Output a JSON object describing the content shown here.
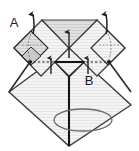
{
  "figure": {
    "type": "paper-folding-diagram",
    "background_color": "#ffffff",
    "paper_fill_color": "#f2f2f2",
    "paper_texture_color": "#e4e4e4",
    "outline_color": "#3a3a3a",
    "dark_line_color": "#111111",
    "shaded_fill_color": "#d0d0d0",
    "dark_fill_color": "#2b2b2b"
  },
  "labels": [
    {
      "name": "label-a",
      "text": "A",
      "x": 14,
      "y": 22
    },
    {
      "name": "label-b",
      "text": "B",
      "x": 89,
      "y": 80
    }
  ],
  "annotations": {
    "arrow_up_left_corner": "fold-up-arrow-left",
    "arrow_up_right_corner": "fold-up-arrow-right",
    "arrow_up_center": "fold-up-arrow-center",
    "arrow_up_inner_left": "fold-up-arrow-inner-left",
    "arrow_up_inner_right": "fold-up-arrow-inner-right",
    "rotation_ellipse": "rotate-indicator-ellipse",
    "dashed_crease": "valley-fold-dashed-crease",
    "axis_line": "vertical-center-axis"
  },
  "geometry": {
    "canvas_width": 139,
    "canvas_height": 151,
    "large_diamond": {
      "top": [
        69,
        48
      ],
      "right": [
        131,
        105
      ],
      "bottom": [
        69,
        146
      ],
      "left": [
        9,
        92
      ]
    },
    "upper_band": {
      "left_outer": [
        14,
        48
      ],
      "left_peak": [
        42,
        20
      ],
      "center_valley": [
        69,
        48
      ],
      "right_peak": [
        97,
        20
      ],
      "right_outer": [
        125,
        48
      ]
    },
    "crease_y": 62,
    "crease_x_start": 29,
    "crease_x_end": 110,
    "inner_triangle": {
      "left": [
        56,
        62
      ],
      "right": [
        84,
        62
      ],
      "apex": [
        70,
        77
      ]
    },
    "rotation_ellipse": {
      "cx": 83,
      "cy": 120,
      "rx": 29,
      "ry": 11
    }
  }
}
